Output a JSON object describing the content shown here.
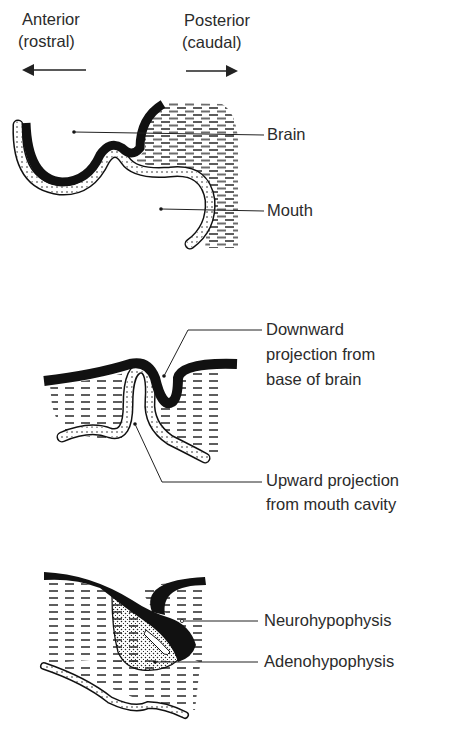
{
  "figure": {
    "orientation": {
      "anterior": {
        "line1": "Anterior",
        "line2": "(rostral)",
        "arrow": "left-arrow"
      },
      "posterior": {
        "line1": "Posterior",
        "line2": "(caudal)",
        "arrow": "right-arrow"
      }
    },
    "panels": [
      {
        "stage": 1,
        "labels": [
          {
            "text": "Brain"
          },
          {
            "text": "Mouth"
          }
        ]
      },
      {
        "stage": 2,
        "labels": [
          {
            "line1": "Downward",
            "line2": "projection from",
            "line3": "base of brain"
          },
          {
            "line1": "Upward projection",
            "line2": "from mouth cavity"
          }
        ]
      },
      {
        "stage": 3,
        "labels": [
          {
            "text": "Neurohypophysis"
          },
          {
            "text": "Adenohypophysis"
          }
        ]
      }
    ],
    "legend_patterns": {
      "black_band": "neural tissue (brain)",
      "dotted_band": "oral ectoderm (mouth lining)",
      "dashed_fill": "surrounding mesenchyme"
    },
    "colors": {
      "ink": "#1a1a1a",
      "background": "#ffffff",
      "text": "#2b2b2b"
    }
  }
}
